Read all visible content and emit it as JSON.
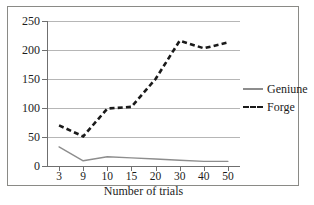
{
  "chart_data": {
    "type": "line",
    "title": "",
    "xlabel": "Number of trials",
    "ylabel": "",
    "categories": [
      "3",
      "9",
      "10",
      "15",
      "20",
      "30",
      "40",
      "50"
    ],
    "ylim": [
      0,
      250
    ],
    "yticks": [
      "0",
      "50",
      "100",
      "150",
      "200",
      "250"
    ],
    "grid": "horizontal",
    "legend_position": "right",
    "series": [
      {
        "name": "Geniune",
        "style": "solid",
        "color": "#8d8d8d",
        "values": [
          33,
          9,
          16,
          14,
          12,
          10,
          8,
          8
        ]
      },
      {
        "name": "Forge",
        "style": "dashed",
        "color": "#1a1a1a",
        "values": [
          70,
          51,
          99,
          102,
          150,
          216,
          203,
          213
        ]
      }
    ]
  }
}
